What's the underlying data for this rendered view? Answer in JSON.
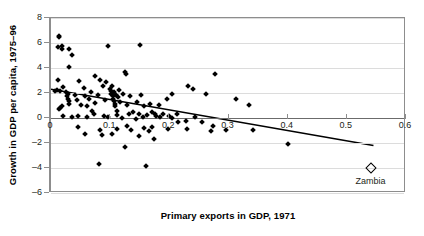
{
  "chart_data": {
    "type": "scatter",
    "title": "",
    "xlabel": "Primary exports in GDP, 1971",
    "ylabel": "Growth in GDP per capita, 1975–96",
    "xlim": [
      0,
      0.6
    ],
    "ylim": [
      -6,
      8
    ],
    "xticks": [
      0,
      0.1,
      0.2,
      0.3,
      0.4,
      0.5,
      0.6
    ],
    "xtick_labels": [
      "0",
      "0.1",
      "0.2",
      "0.3",
      "0.4",
      "0.5",
      "0.6"
    ],
    "yticks": [
      -6,
      -4,
      -2,
      0,
      2,
      4,
      6,
      8
    ],
    "ytick_labels": [
      "–6",
      "–4",
      "–2",
      "0",
      "2",
      "4",
      "6",
      "8"
    ],
    "grid": "horizontal",
    "legend": "none",
    "marker": "filled-diamond",
    "marker_color": "#000000",
    "points": [
      [
        0.013,
        6.55
      ],
      [
        0.014,
        6.45
      ],
      [
        0.012,
        5.65
      ],
      [
        0.018,
        5.75
      ],
      [
        0.019,
        5.55
      ],
      [
        0.03,
        5.55
      ],
      [
        0.036,
        5.05
      ],
      [
        0.031,
        4.05
      ],
      [
        0.096,
        5.75
      ],
      [
        0.15,
        5.85
      ],
      [
        0.125,
        3.7
      ],
      [
        0.126,
        3.55
      ],
      [
        0.012,
        3.05
      ],
      [
        0.047,
        2.95
      ],
      [
        0.075,
        3.4
      ],
      [
        0.083,
        3.05
      ],
      [
        0.006,
        2.2
      ],
      [
        0.01,
        2.25
      ],
      [
        0.016,
        2.2
      ],
      [
        0.021,
        2.45
      ],
      [
        0.025,
        2.05
      ],
      [
        0.028,
        1.95
      ],
      [
        0.027,
        1.75
      ],
      [
        0.029,
        1.55
      ],
      [
        0.03,
        1.35
      ],
      [
        0.031,
        1.15
      ],
      [
        0.019,
        1.0
      ],
      [
        0.016,
        0.8
      ],
      [
        0.013,
        0.75
      ],
      [
        0.04,
        1.85
      ],
      [
        0.044,
        1.45
      ],
      [
        0.05,
        1.05
      ],
      [
        0.056,
        2.4
      ],
      [
        0.058,
        1.75
      ],
      [
        0.06,
        0.95
      ],
      [
        0.064,
        1.55
      ],
      [
        0.068,
        2.05
      ],
      [
        0.07,
        0.55
      ],
      [
        0.074,
        1.2
      ],
      [
        0.079,
        1.85
      ],
      [
        0.088,
        2.55
      ],
      [
        0.091,
        1.45
      ],
      [
        0.093,
        2.85
      ],
      [
        0.1,
        2.35
      ],
      [
        0.101,
        2.15
      ],
      [
        0.102,
        1.95
      ],
      [
        0.103,
        2.6
      ],
      [
        0.104,
        1.75
      ],
      [
        0.105,
        1.55
      ],
      [
        0.106,
        1.35
      ],
      [
        0.107,
        2.05
      ],
      [
        0.108,
        1.15
      ],
      [
        0.109,
        0.95
      ],
      [
        0.11,
        1.85
      ],
      [
        0.112,
        0.6
      ],
      [
        0.113,
        1.65
      ],
      [
        0.115,
        2.25
      ],
      [
        0.117,
        1.25
      ],
      [
        0.122,
        1.95
      ],
      [
        0.128,
        1.05
      ],
      [
        0.133,
        1.75
      ],
      [
        0.139,
        0.45
      ],
      [
        0.145,
        1.25
      ],
      [
        0.152,
        1.85
      ],
      [
        0.158,
        0.95
      ],
      [
        0.168,
        1.15
      ],
      [
        0.176,
        0.3
      ],
      [
        0.183,
        1.05
      ],
      [
        0.196,
        1.55
      ],
      [
        0.204,
        1.95
      ],
      [
        0.232,
        2.55
      ],
      [
        0.24,
        2.35
      ],
      [
        0.262,
        1.9
      ],
      [
        0.277,
        3.55
      ],
      [
        0.313,
        1.55
      ],
      [
        0.335,
        1.05
      ],
      [
        0.089,
        0.15
      ],
      [
        0.097,
        0.05
      ],
      [
        0.112,
        0.25
      ],
      [
        0.12,
        0.0
      ],
      [
        0.131,
        0.3
      ],
      [
        0.143,
        -0.05
      ],
      [
        0.149,
        0.35
      ],
      [
        0.156,
        0.1
      ],
      [
        0.163,
        0.25
      ],
      [
        0.17,
        0.45
      ],
      [
        0.177,
        0.15
      ],
      [
        0.184,
        0.05
      ],
      [
        0.19,
        0.35
      ],
      [
        0.199,
        0.2
      ],
      [
        0.205,
        0.0
      ],
      [
        0.213,
        0.3
      ],
      [
        0.02,
        0.2
      ],
      [
        0.035,
        0.05
      ],
      [
        0.046,
        0.15
      ],
      [
        0.06,
        0.1
      ],
      [
        0.072,
        0.3
      ],
      [
        0.229,
        -0.25
      ],
      [
        0.244,
        0.1
      ],
      [
        0.255,
        -0.3
      ],
      [
        0.273,
        -0.6
      ],
      [
        0.045,
        -0.75
      ],
      [
        0.058,
        -1.25
      ],
      [
        0.082,
        -0.95
      ],
      [
        0.086,
        -1.35
      ],
      [
        0.103,
        -1.25
      ],
      [
        0.112,
        -0.85
      ],
      [
        0.128,
        -0.6
      ],
      [
        0.136,
        -0.95
      ],
      [
        0.148,
        -1.45
      ],
      [
        0.157,
        -0.8
      ],
      [
        0.166,
        -1.05
      ],
      [
        0.17,
        -0.75
      ],
      [
        0.174,
        -1.7
      ],
      [
        0.198,
        -0.9
      ],
      [
        0.215,
        -0.3
      ],
      [
        0.125,
        -2.3
      ],
      [
        0.081,
        -3.65
      ],
      [
        0.16,
        -3.85
      ],
      [
        0.23,
        -0.9
      ],
      [
        0.271,
        -1.0
      ],
      [
        0.342,
        -0.95
      ],
      [
        0.4,
        -2.05
      ],
      [
        0.295,
        -0.95
      ]
    ],
    "highlight_point": {
      "label": "Zambia",
      "x": 0.54,
      "y": -4.0,
      "marker": "open-diamond"
    },
    "trendline": {
      "x0": 0.0,
      "y0": 2.3,
      "x1": 0.545,
      "y1": -2.2,
      "color": "#000000"
    }
  }
}
